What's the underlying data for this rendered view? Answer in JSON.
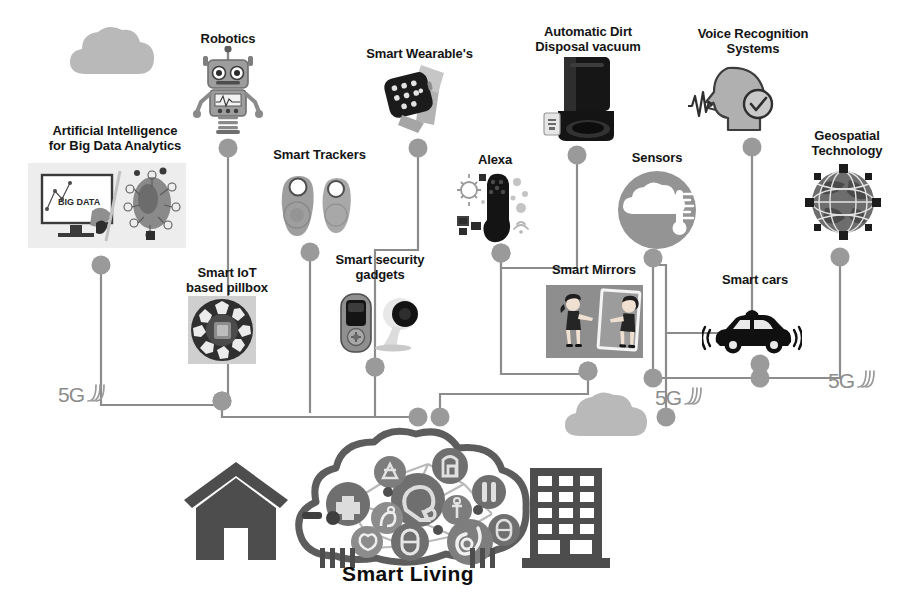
{
  "diagram": {
    "title": "Smart  Living",
    "domain_type": "iot-ecosystem-diagram",
    "background_color": "#ffffff",
    "node_color": "#9a9a9a",
    "wire_color": "#8c8c8c",
    "label_color": "#141414",
    "accent_dark": "#3f3f3f"
  },
  "badges": [
    {
      "id": "fiveg-left",
      "text": "5G",
      "x": 58,
      "y": 382
    },
    {
      "id": "fiveg-middle",
      "text": "5G",
      "x": 655,
      "y": 385
    },
    {
      "id": "fiveg-right",
      "text": "5G",
      "x": 828,
      "y": 368
    }
  ],
  "nodes": [
    {
      "id": "ai-big-data",
      "label": "Artificial Intelligence\nfor Big Data Analytics",
      "icon": "big-data-monitor-icon",
      "label_x": 40,
      "label_y": 123,
      "label_w": 150,
      "art_x": 28,
      "art_y": 163,
      "art_w": 158,
      "art_h": 85,
      "dot_x": 101,
      "dot_y": 265
    },
    {
      "id": "robotics",
      "label": "Robotics",
      "icon": "robot-icon",
      "label_x": 178,
      "label_y": 31,
      "label_w": 100,
      "art_x": 192,
      "art_y": 46,
      "art_w": 72,
      "art_h": 88,
      "dot_x": 228,
      "dot_y": 148
    },
    {
      "id": "smart-wearables",
      "label": "Smart Wearable's",
      "icon": "smart-watch-icon",
      "label_x": 357,
      "label_y": 46,
      "label_w": 125,
      "art_x": 378,
      "art_y": 63,
      "art_w": 85,
      "art_h": 72,
      "dot_x": 418,
      "dot_y": 148
    },
    {
      "id": "automatic-dirt-disposal-vacuum",
      "label": "Automatic Dirt\nDisposal vacuum",
      "icon": "robot-vacuum-icon",
      "label_x": 528,
      "label_y": 24,
      "label_w": 120,
      "art_x": 540,
      "art_y": 57,
      "art_w": 78,
      "art_h": 85,
      "dot_x": 577,
      "dot_y": 155
    },
    {
      "id": "voice-recognition-systems",
      "label": "Voice Recognition\nSystems",
      "icon": "speaking-head-icon",
      "label_x": 688,
      "label_y": 26,
      "label_w": 130,
      "art_x": 688,
      "art_y": 66,
      "art_w": 94,
      "art_h": 70,
      "dot_x": 752,
      "dot_y": 147
    },
    {
      "id": "geospatial-technology",
      "label": "Geospatial\nTechnology",
      "icon": "globe-satellite-icon",
      "label_x": 798,
      "label_y": 128,
      "label_w": 98,
      "art_x": 803,
      "art_y": 162,
      "art_w": 80,
      "art_h": 80,
      "dot_x": 840,
      "dot_y": 257
    },
    {
      "id": "smart-trackers",
      "label": "Smart Trackers",
      "icon": "key-tracker-icon",
      "label_x": 262,
      "label_y": 147,
      "label_w": 115,
      "art_x": 277,
      "art_y": 170,
      "art_w": 85,
      "art_h": 72,
      "dot_x": 310,
      "dot_y": 252
    },
    {
      "id": "alexa",
      "label": "Alexa",
      "icon": "voice-assistant-icon",
      "label_x": 465,
      "label_y": 152,
      "label_w": 60,
      "art_x": 455,
      "art_y": 168,
      "art_w": 88,
      "art_h": 80,
      "dot_x": 501,
      "dot_y": 253
    },
    {
      "id": "sensors",
      "label": "Sensors",
      "icon": "temperature-sensor-icon",
      "label_x": 617,
      "label_y": 150,
      "label_w": 80,
      "art_x": 617,
      "art_y": 170,
      "art_w": 80,
      "art_h": 80,
      "dot_x": 653,
      "dot_y": 258
    },
    {
      "id": "smart-iot-based-pillbox",
      "label": "Smart IoT\nbased pillbox",
      "icon": "pillbox-icon",
      "label_x": 172,
      "label_y": 265,
      "label_w": 110,
      "art_x": 188,
      "art_y": 296,
      "art_w": 68,
      "art_h": 68,
      "dot_x": 222,
      "dot_y": 401
    },
    {
      "id": "smart-security-gadgets",
      "label": "Smart security\ngadgets",
      "icon": "door-lock-camera-icon",
      "label_x": 325,
      "label_y": 252,
      "label_w": 110,
      "art_x": 331,
      "art_y": 292,
      "art_w": 98,
      "art_h": 62,
      "dot_x": 375,
      "dot_y": 367
    },
    {
      "id": "smart-mirrors",
      "label": "Smart Mirrors",
      "icon": "mirror-icon",
      "label_x": 540,
      "label_y": 262,
      "label_w": 108,
      "art_x": 546,
      "art_y": 285,
      "art_w": 97,
      "art_h": 73,
      "dot_x": 588,
      "dot_y": 371
    },
    {
      "id": "smart-cars",
      "label": "Smart cars",
      "icon": "connected-car-icon",
      "label_x": 710,
      "label_y": 272,
      "label_w": 90,
      "art_x": 702,
      "art_y": 300,
      "art_w": 100,
      "art_h": 58,
      "dot_x": 760,
      "dot_y": 364
    }
  ],
  "hub": {
    "id": "smart-living-hub",
    "house_icon": "house-icon",
    "cloud_icon": "network-cloud-icon",
    "building_icon": "office-building-icon",
    "title": "Smart  Living"
  },
  "decor_clouds": [
    {
      "id": "cloud-top-left",
      "x": 66,
      "y": 22,
      "w": 92,
      "h": 58
    },
    {
      "id": "cloud-bottom-right",
      "x": 562,
      "y": 388,
      "w": 88,
      "h": 52
    }
  ],
  "wires": {
    "stroke": "#8c8c8c",
    "stroke_width": 2.2,
    "dot_radius": 9.5,
    "paths": [
      "M101,265 L101,405 L222,405 L222,401",
      "M228,148 L228,398",
      "M310,252 L310,413",
      "M418,148 L418,250 L375,250 L375,367",
      "M375,367 L375,417",
      "M222,401 L222,417 L418,417",
      "M577,155 L577,268 L501,268 L501,253",
      "M501,253 L501,374 L588,374",
      "M588,371 L588,394 L440,394 L440,417",
      "M752,147 L752,333 L666,333 L666,265 L653,265 L653,258",
      "M653,258 L653,378 L760,378",
      "M760,364 L760,378",
      "M840,257 L840,378 L760,378",
      "M666,333 L666,417"
    ]
  }
}
